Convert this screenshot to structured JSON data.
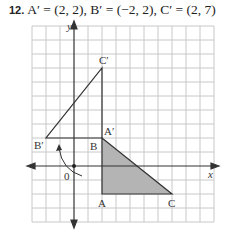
{
  "problem": {
    "number": "12.",
    "statement": "A′ = (2, 2), B′ = (−2, 2), C′ = (2, 7)"
  },
  "graph": {
    "axis_labels": {
      "x": "x",
      "y": "y"
    },
    "origin_label": "0",
    "grid_unit_px": 14,
    "colors": {
      "grid": "#c8c8c8",
      "axis": "#333333",
      "shade": "#b4b4b4",
      "line": "#333333"
    },
    "original_triangle": {
      "points": [
        {
          "label": "A",
          "x": 2,
          "y": -2
        },
        {
          "label": "B",
          "x": 2,
          "y": 2
        },
        {
          "label": "C",
          "x": 7,
          "y": -2
        }
      ],
      "shaded": true
    },
    "image_triangle": {
      "points": [
        {
          "label": "A′",
          "x": 2,
          "y": 2
        },
        {
          "label": "B′",
          "x": -2,
          "y": 2
        },
        {
          "label": "C′",
          "x": 2,
          "y": 7
        }
      ],
      "shaded": false
    },
    "rotation_arrow": "counterclockwise about origin"
  }
}
